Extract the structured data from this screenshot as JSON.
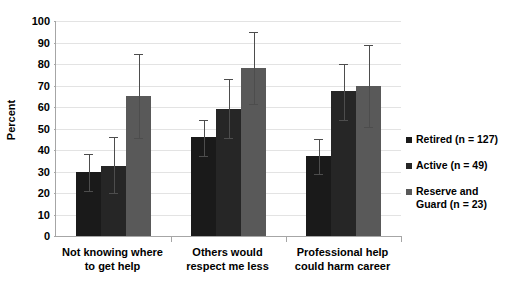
{
  "chart_data": {
    "type": "bar",
    "title": "",
    "xlabel": "",
    "ylabel": "Percent",
    "ylim": [
      0,
      100
    ],
    "ytick_step": 10,
    "yticks": [
      0,
      10,
      20,
      30,
      40,
      50,
      60,
      70,
      80,
      90,
      100
    ],
    "ytick_labels": [
      "0",
      "10",
      "20",
      "30",
      "40",
      "50",
      "60",
      "70",
      "80",
      "90",
      "100"
    ],
    "grid": true,
    "legend_position": "right",
    "error_bars": true,
    "categories": [
      "Not knowing where\nto get help",
      "Others would\nrespect me less",
      "Professional help\ncould harm career"
    ],
    "series": [
      {
        "name": "Retired (n = 127)",
        "color": "#1a1a1a",
        "values": [
          30,
          46,
          37
        ],
        "err_low": [
          21,
          37,
          29
        ],
        "err_high": [
          38,
          54,
          45
        ]
      },
      {
        "name": "Active (n = 49)",
        "color": "#262626",
        "values": [
          32.5,
          59,
          67.5
        ],
        "err_low": [
          20,
          45.5,
          54
        ],
        "err_high": [
          46,
          73,
          80
        ]
      },
      {
        "name": "Reserve and\nGuard (n = 23)",
        "color": "#595959",
        "values": [
          65,
          78,
          70
        ],
        "err_low": [
          45.5,
          61.5,
          50.5
        ],
        "err_high": [
          84.5,
          95,
          89
        ]
      }
    ]
  },
  "legend": {
    "items": [
      {
        "label": "Retired (n = 127)",
        "color": "#1a1a1a"
      },
      {
        "label": "Active (n = 49)",
        "color": "#262626"
      },
      {
        "label": "Reserve and\nGuard (n = 23)",
        "color": "#595959"
      }
    ]
  },
  "axis": {
    "y_title": "Percent"
  }
}
